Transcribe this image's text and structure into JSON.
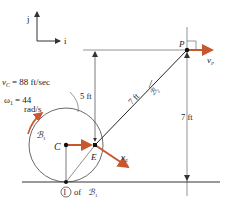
{
  "axes": {
    "j_label": "j",
    "i_label": "i"
  },
  "labels": {
    "vc": "v",
    "vc_sub": "C",
    "vc_value": "= 88 ft/sec",
    "omega": "ω",
    "omega_sub": "1",
    "omega_value": "= 44",
    "omega_unit": "rad/s",
    "body1": "ℬ",
    "body1_sub": "1",
    "body2": "ℬ",
    "body2_sub": "2",
    "point_c": "C",
    "point_e": "E",
    "point_p": "P",
    "vp": "v",
    "vp_sub": "P",
    "ve": "v",
    "ve_sub": "E",
    "dim_5": "5 ft",
    "dim_7_rod": "7 ft",
    "dim_7_height": "7 ft",
    "contact_num": "I",
    "contact_text": "of",
    "contact_body": "ℬ",
    "contact_body_sub": "1"
  },
  "colors": {
    "vector": "#c8562e",
    "line": "#333333"
  }
}
